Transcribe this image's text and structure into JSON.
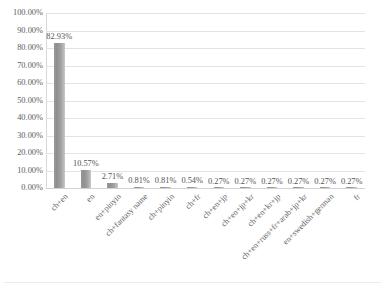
{
  "chart_data": {
    "type": "bar",
    "title": "",
    "xlabel": "",
    "ylabel": "",
    "ylim": [
      0,
      100
    ],
    "grid": true,
    "legend": false,
    "legend_position": "none",
    "bar_color": "#949494",
    "categories": [
      "ch+en",
      "en",
      "en+pinyin",
      "ch+fantasy name",
      "ch+pinyin",
      "ch+fr",
      "ch+en+jp",
      "ch+en+jp+kr",
      "ch+en+kr+jp",
      "ch+en+russ+fr+arab+jp+kr",
      "en+swedish+german",
      "fr"
    ],
    "values": [
      82.93,
      10.57,
      2.71,
      0.81,
      0.81,
      0.54,
      0.27,
      0.27,
      0.27,
      0.27,
      0.27,
      0.27
    ],
    "data_labels": [
      "82.93%",
      "10.57%",
      "2.71%",
      "0.81%",
      "0.81%",
      "0.54%",
      "0.27%",
      "0.27%",
      "0.27%",
      "0.27%",
      "0.27%",
      "0.27%"
    ],
    "ytick_values": [
      0,
      10,
      20,
      30,
      40,
      50,
      60,
      70,
      80,
      90,
      100
    ],
    "ytick_labels": [
      "0.00%",
      "10.00%",
      "20.00%",
      "30.00%",
      "40.00%",
      "50.00%",
      "60.00%",
      "70.00%",
      "80.00%",
      "90.00%",
      "100.00%"
    ]
  }
}
